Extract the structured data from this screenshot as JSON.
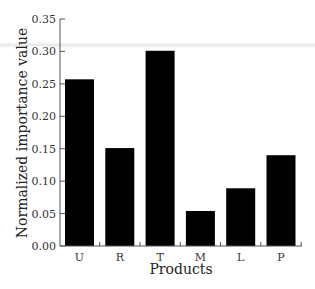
{
  "chart_data": {
    "type": "bar",
    "title": "",
    "xlabel": "Products",
    "ylabel": "Normalized importance value",
    "categories": [
      "U",
      "R",
      "T",
      "M",
      "L",
      "P"
    ],
    "values": [
      0.257,
      0.151,
      0.301,
      0.054,
      0.089,
      0.14
    ],
    "ylim": [
      0.0,
      0.35
    ],
    "yticks": [
      "0.00",
      "0.05",
      "0.10",
      "0.15",
      "0.20",
      "0.25",
      "0.30",
      "0.35"
    ],
    "grid": false,
    "legend": null,
    "bar_color": "#000000"
  }
}
